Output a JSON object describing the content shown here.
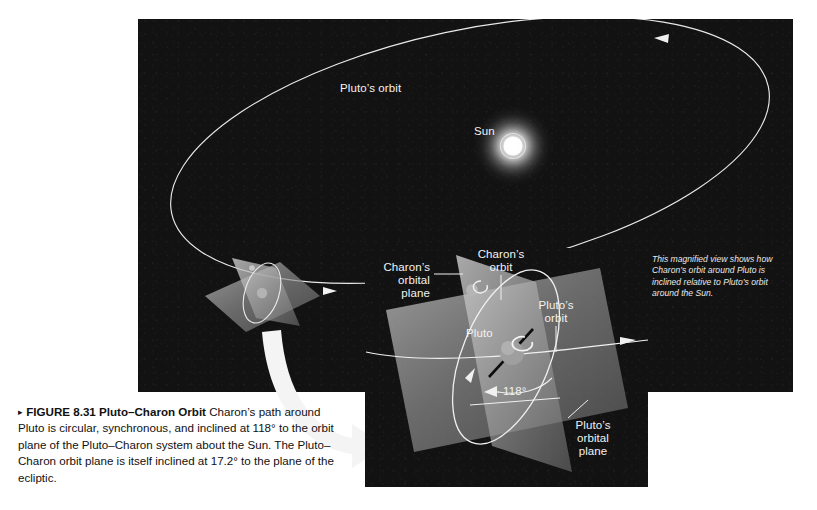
{
  "figure": {
    "marker": "▸",
    "number": "FIGURE 8.31",
    "title": "Pluto–Charon Orbit",
    "caption_body": "Charon’s path around Pluto is circular, synchronous, and inclined at 118° to the orbit plane of the Pluto–Charon system about the Sun. The Pluto–Charon orbit plane is itself inclined at 17.2° to the plane of the ecliptic."
  },
  "main_scene": {
    "pluto_orbit_label": "Pluto’s orbit",
    "sun_label": "Sun"
  },
  "magnified_note": "This magnified view shows how\nCharon’s orbit around Pluto is\ninclined relative to Pluto’s orbit\naround the Sun.",
  "inset": {
    "charons_orbit_label": "Charon’s\norbit",
    "charons_orbital_plane_label": "Charon’s\norbital\nplane",
    "plutos_orbit_label": "Pluto’s\norbit",
    "plutos_orbital_plane_label": "Pluto’s\norbital\nplane",
    "pluto_label": "Pluto",
    "inclination_angle": "118°"
  },
  "colors": {
    "background": "#ffffff",
    "panel": "#121212",
    "orbit_line": "#f0f0f0",
    "plane_fill": "#8d8d8d",
    "label_text": "#f2f2f2",
    "caption_text": "#111111",
    "sun_glow": "#ffffff",
    "zoom_arrow": "#f2f2f2"
  }
}
